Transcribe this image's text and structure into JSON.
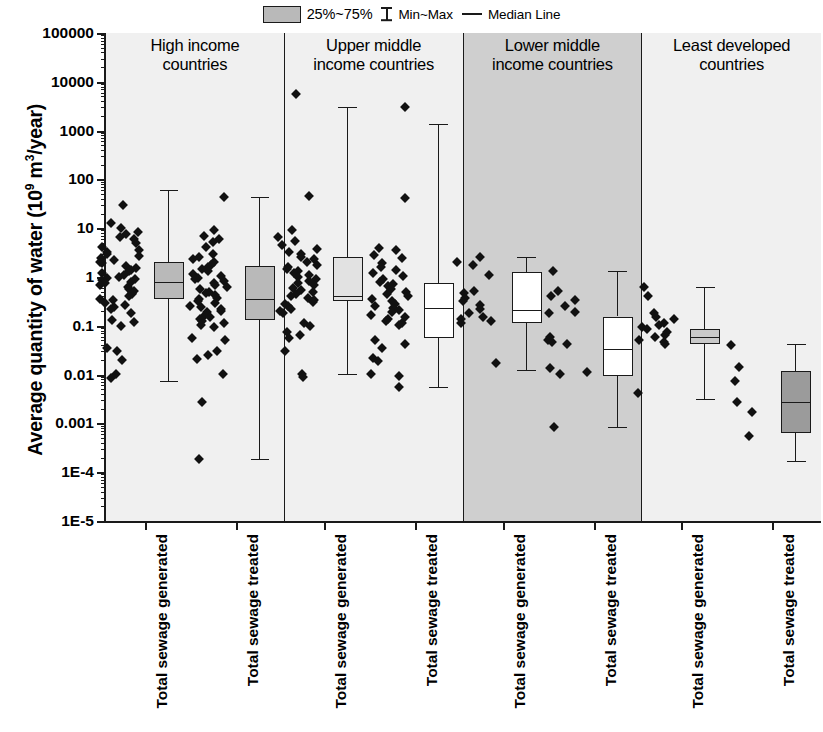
{
  "legend": {
    "items": [
      {
        "name": "box-swatch",
        "label": "25%~75%",
        "kind": "swatch"
      },
      {
        "name": "minmax-glyph",
        "label": "Min~Max",
        "kind": "minmax"
      },
      {
        "name": "median-glyph",
        "label": "Median Line",
        "kind": "median"
      }
    ]
  },
  "axis": {
    "y_title_main": "Average quantity of water (10",
    "y_title_sup": "9",
    "y_title_tail": " m",
    "y_title_sup2": "3",
    "y_title_tail2": "/year)",
    "y_ticks": [
      "100000",
      "10000",
      "1000",
      "100",
      "10",
      "1",
      "0.1",
      "0.01",
      "0.001",
      "1E-4",
      "1E-5"
    ],
    "x_labels": [
      "Total sewage generated",
      "Total sewage treated",
      "Total sewage generated",
      "Total sewage treated",
      "Total sewage generated",
      "Total sewage treated",
      "Total sewage generated",
      "Total sewage treated"
    ]
  },
  "panels": [
    {
      "title": "High income\ncountries",
      "bg": "#f0f0f0"
    },
    {
      "title": "Upper middle\nincome countries",
      "bg": "#f0f0f0"
    },
    {
      "title": "Lower middle\nincome countries",
      "bg": "#cfcfcf"
    },
    {
      "title": "Least developed\ncountries",
      "bg": "#f0f0f0"
    }
  ],
  "chart_data": {
    "type": "box",
    "title": "",
    "xlabel": "",
    "ylabel": "Average quantity of water (10^9 m^3/year)",
    "yscale": "log",
    "ylim": [
      1e-05,
      100000
    ],
    "ytick_values": [
      100000,
      10000,
      1000,
      100,
      10,
      1,
      0.1,
      0.01,
      0.001,
      0.0001,
      1e-05
    ],
    "grid": false,
    "legend_position": "top-center",
    "groups": [
      "High income countries",
      "Upper middle income countries",
      "Lower middle income countries",
      "Least developed countries"
    ],
    "categories": [
      "Total sewage generated",
      "Total sewage treated",
      "Total sewage generated",
      "Total sewage treated",
      "Total sewage generated",
      "Total sewage treated",
      "Total sewage generated",
      "Total sewage treated"
    ],
    "boxes": [
      {
        "group": "High income countries",
        "category": "Total sewage generated",
        "min": 0.0075,
        "q1": 0.35,
        "median": 0.8,
        "q3": 2.0,
        "max": 60,
        "fill": "#b9b9b9"
      },
      {
        "group": "High income countries",
        "category": "Total sewage treated",
        "min": 0.00019,
        "q1": 0.13,
        "median": 0.35,
        "q3": 1.7,
        "max": 44,
        "fill": "#b9b9b9"
      },
      {
        "group": "Upper middle income countries",
        "category": "Total sewage generated",
        "min": 0.0105,
        "q1": 0.32,
        "median": 0.4,
        "q3": 2.6,
        "max": 3000,
        "fill": "#e2e2e2"
      },
      {
        "group": "Upper middle income countries",
        "category": "Total sewage treated",
        "min": 0.0055,
        "q1": 0.055,
        "median": 0.23,
        "q3": 0.75,
        "max": 1350,
        "fill": "#ffffff"
      },
      {
        "group": "Lower middle income countries",
        "category": "Total sewage generated",
        "min": 0.0125,
        "q1": 0.115,
        "median": 0.21,
        "q3": 1.25,
        "max": 2.6,
        "fill": "#ffffff"
      },
      {
        "group": "Lower middle income countries",
        "category": "Total sewage treated",
        "min": 0.00085,
        "q1": 0.0095,
        "median": 0.034,
        "q3": 0.155,
        "max": 1.35,
        "fill": "#ffffff"
      },
      {
        "group": "Least developed countries",
        "category": "Total sewage generated",
        "min": 0.0032,
        "q1": 0.042,
        "median": 0.058,
        "q3": 0.085,
        "max": 0.62,
        "fill": "#c9c9c9"
      },
      {
        "group": "Least developed countries",
        "category": "Total sewage treated",
        "min": 0.00017,
        "q1": 0.00065,
        "median": 0.0028,
        "q3": 0.012,
        "max": 0.042,
        "fill": "#9b9b9b"
      }
    ],
    "scatter": [
      {
        "group": "High income countries",
        "category": "Total sewage generated",
        "values": [
          30,
          13,
          10,
          8.5,
          7.5,
          6.5,
          6.0,
          5.0,
          4.2,
          3.6,
          3.2,
          3.0,
          2.7,
          2.4,
          2.2,
          2.0,
          1.9,
          1.7,
          1.55,
          1.4,
          1.3,
          1.2,
          1.1,
          1.0,
          0.95,
          0.9,
          0.85,
          0.8,
          0.75,
          0.7,
          0.62,
          0.58,
          0.52,
          0.48,
          0.44,
          0.4,
          0.36,
          0.33,
          0.3,
          0.27,
          0.24,
          0.22,
          0.18,
          0.13,
          0.12,
          0.1,
          0.035,
          0.03,
          0.02,
          0.0105,
          0.0085
        ]
      },
      {
        "group": "High income countries",
        "category": "Total sewage treated",
        "values": [
          44,
          9.0,
          7.0,
          6.0,
          5.2,
          4.2,
          3.0,
          2.6,
          2.3,
          2.0,
          1.8,
          1.6,
          1.45,
          1.3,
          1.15,
          1.05,
          0.95,
          0.9,
          0.82,
          0.75,
          0.68,
          0.62,
          0.56,
          0.5,
          0.46,
          0.42,
          0.38,
          0.35,
          0.32,
          0.29,
          0.26,
          0.24,
          0.22,
          0.2,
          0.19,
          0.17,
          0.15,
          0.14,
          0.125,
          0.115,
          0.105,
          0.095,
          0.055,
          0.05,
          0.03,
          0.025,
          0.021,
          0.0105,
          0.0027,
          0.00019
        ]
      },
      {
        "group": "Upper middle income countries",
        "category": "Total sewage generated",
        "values": [
          5500,
          45,
          9.0,
          6.5,
          5.5,
          4.5,
          3.8,
          3.3,
          2.9,
          2.6,
          2.3,
          2.0,
          1.8,
          1.6,
          1.45,
          1.3,
          1.2,
          1.1,
          1.0,
          0.9,
          0.82,
          0.74,
          0.68,
          0.6,
          0.55,
          0.5,
          0.45,
          0.41,
          0.37,
          0.34,
          0.31,
          0.28,
          0.25,
          0.22,
          0.2,
          0.18,
          0.115,
          0.1,
          0.075,
          0.065,
          0.055,
          0.03,
          0.0105,
          0.0088
        ]
      },
      {
        "group": "Upper middle income countries",
        "category": "Total sewage treated",
        "values": [
          3000,
          42,
          4.0,
          3.5,
          2.8,
          2.4,
          1.9,
          1.6,
          1.4,
          1.2,
          1.05,
          0.92,
          0.8,
          0.72,
          0.64,
          0.56,
          0.5,
          0.45,
          0.4,
          0.36,
          0.32,
          0.28,
          0.25,
          0.23,
          0.21,
          0.19,
          0.17,
          0.155,
          0.14,
          0.125,
          0.115,
          0.105,
          0.05,
          0.043,
          0.035,
          0.022,
          0.019,
          0.0105,
          0.0095,
          0.0055
        ]
      },
      {
        "group": "Lower middle income countries",
        "category": "Total sewage generated",
        "values": [
          2.6,
          2.0,
          1.8,
          1.1,
          0.52,
          0.46,
          0.38,
          0.32,
          0.27,
          0.22,
          0.185,
          0.155,
          0.135,
          0.125,
          0.115,
          0.0175
        ]
      },
      {
        "group": "Lower middle income countries",
        "category": "Total sewage treated",
        "values": [
          1.35,
          0.52,
          0.4,
          0.33,
          0.26,
          0.195,
          0.185,
          0.06,
          0.05,
          0.046,
          0.042,
          0.0135,
          0.0115,
          0.0105,
          0.00085
        ]
      },
      {
        "group": "Least developed countries",
        "category": "Total sewage generated",
        "values": [
          0.62,
          0.4,
          0.185,
          0.155,
          0.135,
          0.115,
          0.105,
          0.095,
          0.085,
          0.075,
          0.065,
          0.058,
          0.052,
          0.046,
          0.042,
          0.0042
        ]
      },
      {
        "group": "Least developed countries",
        "category": "Total sewage treated",
        "values": [
          0.04,
          0.0145,
          0.0075,
          0.0028,
          0.0017,
          0.00055
        ]
      }
    ]
  }
}
